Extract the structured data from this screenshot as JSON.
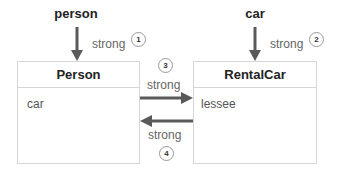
{
  "variables": {
    "left": "person",
    "right": "car"
  },
  "classes": {
    "left": {
      "title": "Person",
      "property": "car"
    },
    "right": {
      "title": "RentalCar",
      "property": "lessee"
    }
  },
  "references": [
    {
      "number": "1",
      "label": "strong"
    },
    {
      "number": "2",
      "label": "strong"
    },
    {
      "number": "3",
      "label": "strong"
    },
    {
      "number": "4",
      "label": "strong"
    }
  ],
  "colors": {
    "arrow": "#5a5a5a",
    "border": "#d6d6d6"
  }
}
